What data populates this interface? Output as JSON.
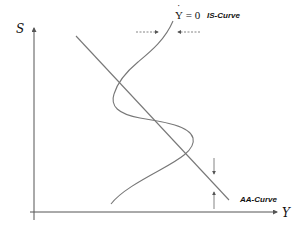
{
  "diagram": {
    "type": "economics-phase-diagram",
    "axes": {
      "y_label": "S",
      "x_label": "Y"
    },
    "curves": {
      "is_curve": {
        "label": "IS-Curve",
        "condition_symbol": "Y",
        "condition_rest": " = 0",
        "shape": "S-shaped (sigmoid wiggle), crossing AA three times"
      },
      "aa_curve": {
        "label": "AA-Curve",
        "shape": "downward-sloping straight line"
      }
    },
    "arrows": {
      "horizontal": [
        "right-pointing dashed arrow left of IS",
        "left-pointing dashed arrow right of IS"
      ],
      "vertical": [
        "down-pointing arrow above AA",
        "up-pointing arrow below AA"
      ]
    },
    "intersections": 3,
    "colors": {
      "line": "#777777",
      "axis": "#555555",
      "text": "#111111",
      "background": "#ffffff"
    }
  }
}
